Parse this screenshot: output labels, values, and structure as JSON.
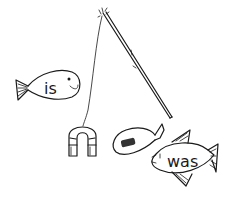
{
  "illustration": {
    "subject": "fishing rod with magnet catching word fish",
    "fish_left": {
      "word": "is"
    },
    "fish_right": {
      "word": "was"
    },
    "fish_small": {
      "word": ""
    },
    "rod": {
      "label": "fishing-rod"
    },
    "magnet": {
      "label": "horseshoe-magnet"
    }
  },
  "colors": {
    "ink": "#1a1a1a",
    "background": "#ffffff",
    "metal": "#333333"
  }
}
